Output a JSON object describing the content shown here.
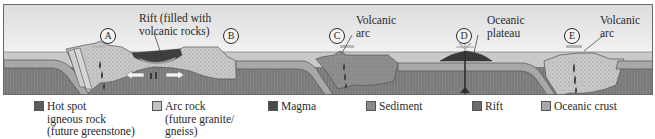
{
  "diagram": {
    "labels": {
      "rift": [
        "Rift (filled with",
        "volcanic rocks)"
      ],
      "volcanic_arc_c": [
        "Volcanic",
        "arc"
      ],
      "oceanic_plateau": [
        "Oceanic",
        "plateau"
      ],
      "volcanic_arc_e": [
        "Volcanic",
        "arc"
      ]
    },
    "markers": [
      "A",
      "B",
      "C",
      "D",
      "E"
    ]
  },
  "legend": {
    "items": [
      {
        "label": "Hot spot\nigneous rock\n(future greenstone)",
        "color": "#5c5c5c"
      },
      {
        "label": "Arc rock\n(future granite/\ngneiss)",
        "color": "#c4c4c4"
      },
      {
        "label": "Magma",
        "color": "#4a4a4a"
      },
      {
        "label": "Sediment",
        "color": "#8a8a8a"
      },
      {
        "label": "Rift",
        "color": "#6e6e6e"
      },
      {
        "label": "Oceanic crust",
        "color": "#a8a8a8"
      }
    ]
  },
  "colors": {
    "sky": "#ececec",
    "sea": "#c9c9c9",
    "oceanic_crust": "#a3a3a3",
    "mantle": "#7c7c7c",
    "arc_rock": "#c6c6c6",
    "sediment_arc": "#8c8c8c",
    "hot_spot": "#3e3e3e"
  }
}
